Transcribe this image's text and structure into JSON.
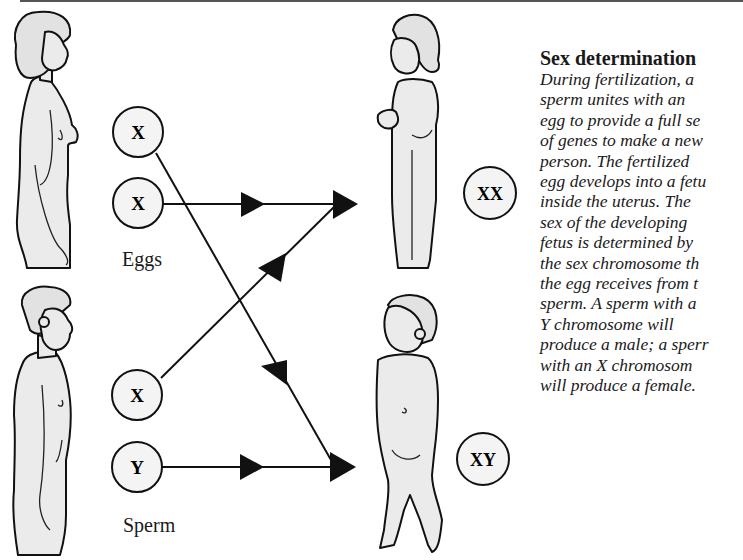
{
  "caption": {
    "title": "Sex determination",
    "lines": [
      "During fertilization, a",
      "sperm unites with an",
      "egg to provide a full se",
      "of genes to make a new",
      "person. The fertilized",
      "egg develops into a fetu",
      "inside the uterus. The",
      "sex of the developing",
      "fetus is determined by",
      "the sex chromosome th",
      "the egg receives from t",
      "sperm. A sperm with a",
      "Y chromosome will",
      "produce a male; a sperr",
      "with an X chromosom",
      "will produce a female."
    ]
  },
  "diagram": {
    "eggs_label": "Eggs",
    "sperm_label": "Sperm",
    "egg_cells": [
      {
        "chromosome": "X"
      },
      {
        "chromosome": "X"
      }
    ],
    "sperm_cells": [
      {
        "chromosome": "X"
      },
      {
        "chromosome": "Y"
      }
    ],
    "offspring": [
      {
        "genotype": "XX",
        "figure": "girl"
      },
      {
        "genotype": "XY",
        "figure": "boy"
      }
    ],
    "parents": [
      {
        "figure": "woman"
      },
      {
        "figure": "man"
      }
    ],
    "colors": {
      "line": "#111111",
      "cell_fill": "#f4f4f4",
      "skin_fill": "#ebebeb"
    }
  }
}
